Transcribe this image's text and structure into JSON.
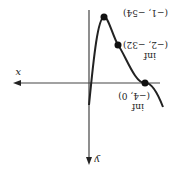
{
  "orientation": "rotated-180",
  "axes": {
    "x_label": "x",
    "y_label": "y",
    "color": "#333333"
  },
  "curve": {
    "color": "#222222",
    "description": "cubic-like curve with local max at (-1, -54) shown inverted"
  },
  "points": [
    {
      "coord": "(−1, −54)",
      "tag": ""
    },
    {
      "coord": "(−2, −32)",
      "tag": "inf"
    },
    {
      "coord": "(−4, 0)",
      "tag": "inf"
    }
  ]
}
